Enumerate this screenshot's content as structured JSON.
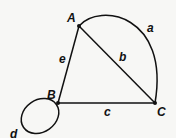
{
  "graph": {
    "nodes": [
      {
        "id": "A",
        "label": "A",
        "x": 79,
        "y": 26
      },
      {
        "id": "B",
        "label": "B",
        "x": 58,
        "y": 103
      },
      {
        "id": "C",
        "label": "C",
        "x": 155,
        "y": 103
      }
    ],
    "edges": [
      {
        "id": "a",
        "label": "a",
        "from": "A",
        "to": "C",
        "shape": "arc"
      },
      {
        "id": "b",
        "label": "b",
        "from": "A",
        "to": "C",
        "shape": "line"
      },
      {
        "id": "c",
        "label": "c",
        "from": "B",
        "to": "C",
        "shape": "line"
      },
      {
        "id": "d",
        "label": "d",
        "from": "B",
        "to": "B",
        "shape": "loop"
      },
      {
        "id": "e",
        "label": "e",
        "from": "A",
        "to": "B",
        "shape": "line"
      }
    ]
  },
  "colors": {
    "stroke": "#111111",
    "background": "#f7f7f5"
  }
}
